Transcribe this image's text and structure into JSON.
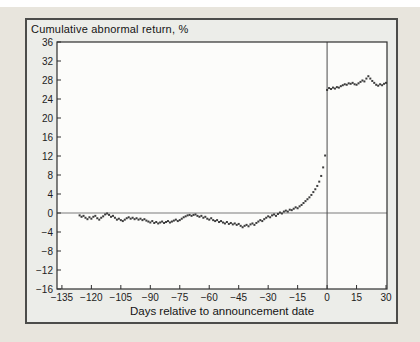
{
  "chart_data": {
    "type": "scatter",
    "title": "Cumulative abnormal return, %",
    "xlabel": "Days relative to announcement date",
    "ylabel": "Cumulative abnormal return, %",
    "xlim": [
      -137.5,
      30.5
    ],
    "ylim": [
      -16,
      36
    ],
    "grid": false,
    "legend": "none",
    "x_ticks": [
      -135,
      -120,
      -105,
      -90,
      -75,
      -60,
      -45,
      -30,
      -15,
      0,
      15,
      30
    ],
    "x_tick_labels": [
      "−135",
      "−120",
      "−105",
      "−90",
      "−75",
      "−60",
      "−45",
      "−30",
      "−15",
      "0",
      "15",
      "30"
    ],
    "y_ticks": [
      36,
      32,
      28,
      24,
      20,
      16,
      12,
      8,
      4,
      0,
      -4,
      -8,
      -12,
      -16
    ],
    "y_tick_labels": [
      "36",
      "32",
      "28",
      "24",
      "20",
      "16",
      "12",
      "8",
      "4",
      "0",
      "−4",
      "−8",
      "−12",
      "−16"
    ],
    "reference_lines": {
      "horizontal_y": 0,
      "vertical_x": 0
    },
    "marker": {
      "shape": "square",
      "size_px": 2
    },
    "series": [
      {
        "name": "Cumulative abnormal return",
        "x_start": -126,
        "x_step": 1,
        "values": [
          -0.5,
          -0.8,
          -0.6,
          -1.0,
          -1.3,
          -0.9,
          -1.2,
          -0.8,
          -0.6,
          -1.1,
          -1.4,
          -1.0,
          -0.7,
          -0.3,
          -0.1,
          -0.4,
          -0.8,
          -0.6,
          -1.0,
          -1.4,
          -1.2,
          -1.5,
          -1.7,
          -1.4,
          -1.1,
          -0.9,
          -1.2,
          -1.0,
          -1.3,
          -1.1,
          -1.4,
          -1.2,
          -1.5,
          -1.3,
          -1.6,
          -1.8,
          -2.0,
          -1.7,
          -2.1,
          -1.9,
          -2.2,
          -2.0,
          -1.8,
          -2.1,
          -1.9,
          -1.7,
          -2.0,
          -1.8,
          -1.6,
          -1.4,
          -1.7,
          -1.5,
          -1.2,
          -0.9,
          -0.7,
          -0.5,
          -0.4,
          -0.6,
          -0.4,
          -0.3,
          -0.6,
          -0.8,
          -0.6,
          -1.0,
          -0.8,
          -1.2,
          -1.4,
          -1.1,
          -1.5,
          -1.7,
          -1.5,
          -1.9,
          -1.7,
          -2.0,
          -2.2,
          -1.9,
          -2.3,
          -2.1,
          -2.4,
          -2.2,
          -2.5,
          -2.3,
          -2.7,
          -3.0,
          -2.7,
          -2.5,
          -2.8,
          -2.4,
          -2.2,
          -2.5,
          -2.1,
          -1.8,
          -1.5,
          -1.7,
          -1.3,
          -1.0,
          -0.7,
          -0.9,
          -0.5,
          -0.3,
          -0.6,
          -0.2,
          0.1,
          -0.1,
          0.3,
          0.5,
          0.3,
          0.7,
          0.6,
          0.9,
          1.2,
          1.0,
          1.4,
          1.7,
          2.1,
          2.5,
          2.9,
          3.3,
          3.8,
          4.4,
          5.0,
          5.7,
          6.6,
          7.8,
          9.6,
          12.1,
          25.9,
          26.3,
          26.1,
          26.4,
          26.2,
          26.5,
          26.4,
          26.7,
          26.9,
          27.1,
          27.0,
          27.3,
          27.2,
          27.4,
          27.1,
          27.0,
          27.3,
          27.6,
          27.9,
          27.7,
          28.3,
          28.8,
          28.3,
          27.8,
          27.4,
          27.0,
          26.8,
          27.1,
          26.9,
          27.2,
          27.4
        ]
      }
    ]
  },
  "colors": {
    "page_top_strip": "#ffffff",
    "page_background": "#e8e5dd",
    "panel_background": "#ecede9",
    "panel_border": "#4c4c4a",
    "plot_background": "#fcfcfa",
    "frame": "#2e2e2e",
    "zero_line": "#7a7a7a",
    "event_line": "#4a4a4a",
    "marker": "#3d3d3d",
    "text": "#1c1c1c"
  }
}
